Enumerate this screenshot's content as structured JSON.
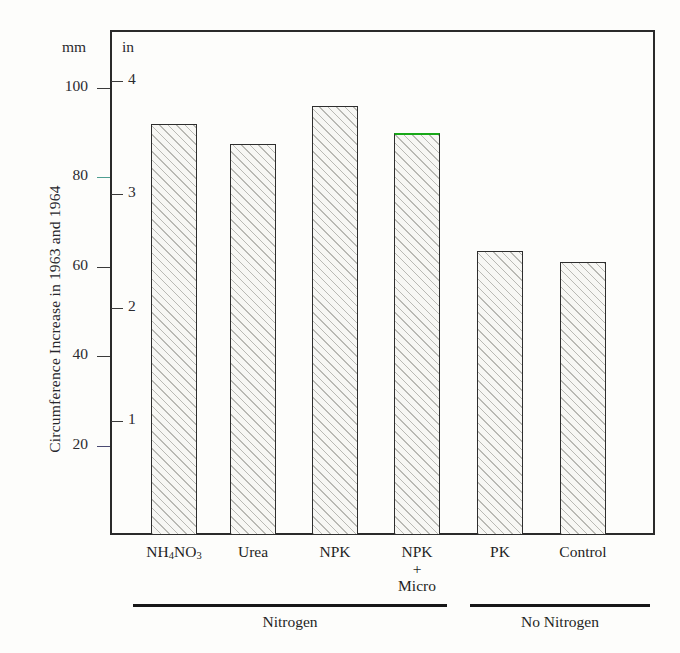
{
  "chart_data": {
    "type": "bar",
    "title": "",
    "ylabel": "Circumference Increase in 1963 and 1964",
    "xlabel": "",
    "categories": [
      "NH4NO3",
      "Urea",
      "NPK",
      "NPK + Micro",
      "PK",
      "Control"
    ],
    "category_labels": [
      {
        "lines": [
          "NH4NO3"
        ],
        "html": "NH<sub>4</sub>NO<sub>3</sub>"
      },
      {
        "lines": [
          "Urea"
        ],
        "html": "Urea"
      },
      {
        "lines": [
          "NPK"
        ],
        "html": "NPK"
      },
      {
        "lines": [
          "NPK",
          "+",
          "Micro"
        ],
        "html": "NPK<br>+<br>Micro"
      },
      {
        "lines": [
          "PK"
        ],
        "html": "PK"
      },
      {
        "lines": [
          "Control"
        ],
        "html": "Control"
      }
    ],
    "values": [
      92,
      87.5,
      96,
      90,
      63.5,
      61
    ],
    "unit_primary": "mm",
    "unit_secondary": "in",
    "ylim": [
      0,
      105
    ],
    "yticks_mm": [
      20,
      40,
      60,
      80,
      100
    ],
    "yticks_in": [
      1,
      2,
      3,
      4
    ],
    "ytick_labels_mm": [
      "20",
      "40",
      "60",
      "80",
      "100"
    ],
    "ytick_labels_in": [
      "1",
      "2",
      "3",
      "4"
    ],
    "grid": false,
    "legend": null,
    "bar_fill": "#f7f7f4",
    "bar_hatch": "diagonal-45",
    "bar_edge": "#2e2e2e",
    "highlight_color": "#18a818",
    "highlighted_bar": "NPK + Micro",
    "groups": [
      {
        "label": "Nitrogen",
        "members": [
          "NH4NO3",
          "Urea",
          "NPK",
          "NPK + Micro"
        ]
      },
      {
        "label": "No Nitrogen",
        "members": [
          "PK",
          "Control"
        ]
      }
    ]
  },
  "axis": {
    "unit_left": "mm",
    "unit_right": "in"
  }
}
